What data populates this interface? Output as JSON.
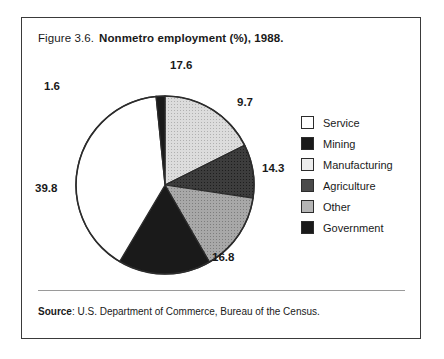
{
  "figure": {
    "number": "Figure 3.6.",
    "title": "Nonmetro employment (%), 1988.",
    "source_label": "Source",
    "source_text": ": U.S. Department of Commerce, Bureau of the Census."
  },
  "chart_data": {
    "type": "pie",
    "title": "Nonmetro employment (%), 1988.",
    "xlabel": "",
    "ylabel": "",
    "legend_position": "right",
    "grid": false,
    "unit": "%",
    "total": 99.8,
    "start_angle_deg": 0,
    "direction": "clockwise",
    "categories": [
      "Other",
      "Agriculture",
      "Manufacturing",
      "Mining",
      "Service",
      "Government"
    ],
    "values": [
      17.6,
      9.7,
      14.3,
      16.8,
      39.8,
      1.6
    ],
    "slices": [
      {
        "label": "Other",
        "value": 17.6,
        "value_text": "17.6",
        "color": "#d4d4d4",
        "pattern": "light-stipple"
      },
      {
        "label": "Agriculture",
        "value": 9.7,
        "value_text": "9.7",
        "color": "#3a3a3a",
        "pattern": "dark-stipple"
      },
      {
        "label": "Manufacturing",
        "value": 14.3,
        "value_text": "14.3",
        "color": "#9e9e9e",
        "pattern": "mid-stipple"
      },
      {
        "label": "Mining",
        "value": 16.8,
        "value_text": "16.8",
        "color": "#1a1a1a",
        "pattern": "solid-dark"
      },
      {
        "label": "Service",
        "value": 39.8,
        "value_text": "39.8",
        "color": "#ffffff",
        "pattern": "none"
      },
      {
        "label": "Government",
        "value": 1.6,
        "value_text": "1.6",
        "color": "#1a1a1a",
        "pattern": "solid-dark"
      }
    ]
  },
  "legend": {
    "items": [
      {
        "label": "Service",
        "color": "#ffffff",
        "pattern": "none"
      },
      {
        "label": "Mining",
        "color": "#1a1a1a",
        "pattern": "solid-dark"
      },
      {
        "label": "Manufacturing",
        "color": "#ededed",
        "pattern": "very-light"
      },
      {
        "label": "Agriculture",
        "color": "#4a4a4a",
        "pattern": "dark-stipple"
      },
      {
        "label": "Other",
        "color": "#b5b5b5",
        "pattern": "mid-stipple"
      },
      {
        "label": "Government",
        "color": "#1f1f1f",
        "pattern": "solid-dark"
      }
    ]
  }
}
